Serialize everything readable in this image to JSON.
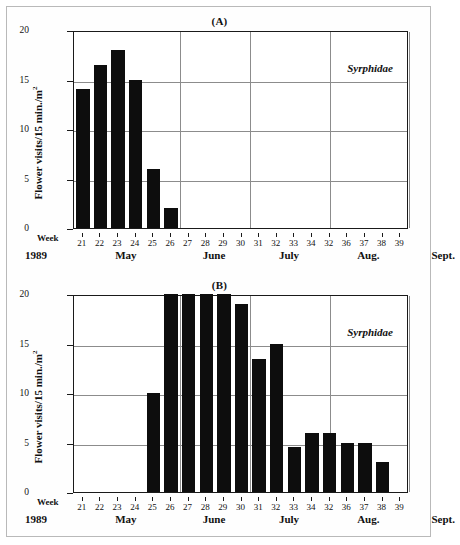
{
  "figure": {
    "year_label": "1989",
    "week_word": "Week",
    "taxon": "Syrphidae",
    "panel_a_label": "(A)",
    "panel_b_label": "(B)",
    "ylabel_main": "Flower visits/15 min./m",
    "ylabel_exp": "2"
  },
  "chart_data": [
    {
      "type": "bar",
      "title": "(A)",
      "xlabel": "Week",
      "ylabel": "Flower visits/15 min./m2",
      "ylim": [
        0,
        20
      ],
      "yticks": [
        0,
        5,
        10,
        15,
        20
      ],
      "ytick_labels": [
        "0",
        "5",
        "10",
        "15",
        "20"
      ],
      "grid": "horizontal-and-vertical",
      "legend": "Syrphidae",
      "legend_position": "top-right-inside",
      "categories": [
        "21",
        "22",
        "23",
        "24",
        "25",
        "26",
        "27",
        "28",
        "29",
        "30",
        "31",
        "32",
        "33",
        "34",
        "32",
        "36",
        "37",
        "38",
        "39"
      ],
      "values": [
        14,
        16.5,
        18,
        15,
        6,
        2,
        0,
        0,
        0,
        0,
        0,
        0,
        0,
        0,
        0,
        0,
        0,
        0,
        0
      ],
      "month_axis": [
        "May",
        "June",
        "July",
        "Aug.",
        "Sept."
      ],
      "year": "1989"
    },
    {
      "type": "bar",
      "title": "(B)",
      "xlabel": "Week",
      "ylabel": "Flower visits/15 min./m2",
      "ylim": [
        0,
        20
      ],
      "yticks": [
        0,
        5,
        10,
        15,
        20
      ],
      "ytick_labels": [
        "0",
        "5",
        "10",
        "15",
        "20"
      ],
      "grid": "horizontal-and-vertical",
      "legend": "Syrphidae",
      "legend_position": "top-right-inside",
      "categories": [
        "21",
        "22",
        "23",
        "24",
        "25",
        "26",
        "27",
        "28",
        "29",
        "30",
        "31",
        "32",
        "33",
        "34",
        "32",
        "36",
        "37",
        "38",
        "39"
      ],
      "values": [
        0,
        0,
        0,
        0,
        10,
        20,
        20,
        20,
        20,
        19,
        13.4,
        15,
        4.5,
        6,
        6,
        5,
        5,
        3,
        0
      ],
      "month_axis": [
        "May",
        "June",
        "July",
        "Aug.",
        "Sept."
      ],
      "year": "1989"
    }
  ],
  "axis": {
    "week_ticks": [
      "21",
      "22",
      "23",
      "24",
      "25",
      "26",
      "27",
      "28",
      "29",
      "30",
      "31",
      "32",
      "33",
      "34",
      "32",
      "36",
      "37",
      "38",
      "39"
    ],
    "months": [
      "May",
      "June",
      "July",
      "Aug.",
      "Sept."
    ]
  }
}
